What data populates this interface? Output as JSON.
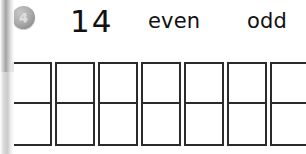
{
  "worksheet": {
    "item_badge": {
      "icon": "circle-badge",
      "number": "4"
    },
    "problem_number": "14",
    "choices": [
      {
        "label": "even",
        "left": 148
      },
      {
        "label": "odd",
        "left": 247
      }
    ],
    "answer_grid": {
      "icon": "ten-frame-grid",
      "columns": 7,
      "cells_per_column": 2,
      "total_cells": 14,
      "column_width": 40,
      "column_height": 84,
      "column_lefts": [
        12,
        55,
        98,
        141,
        184,
        227,
        270
      ],
      "last_column_clipped": true,
      "border_color": "#2b2b2b",
      "fill_color": "#ffffff"
    },
    "colors": {
      "page_background": "#ffffff",
      "ink": "#111111",
      "badge_fill": "#ababab",
      "badge_text": "#dedede",
      "box_border": "#2b2b2b",
      "binding_shadow": "#9a9a9a"
    }
  }
}
